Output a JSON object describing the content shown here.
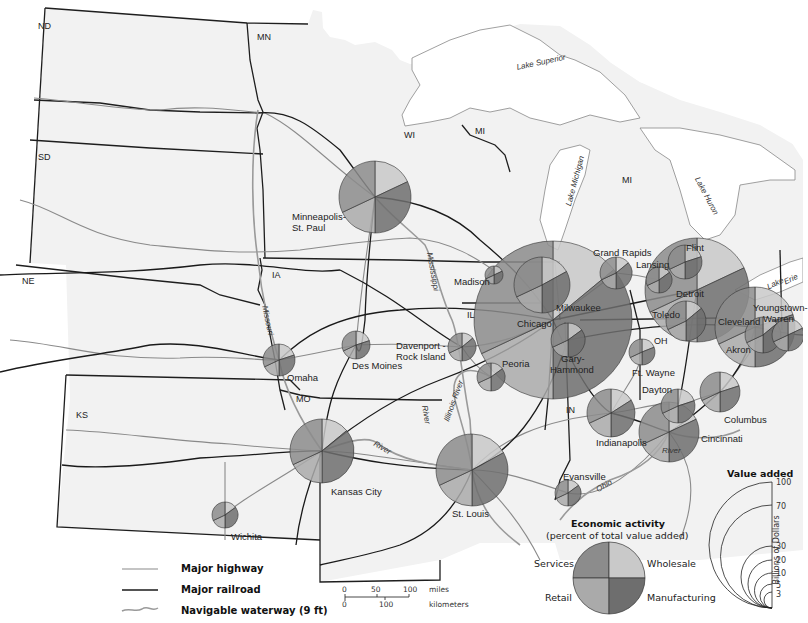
{
  "chart_data": {
    "type": "map",
    "states": [
      "ND",
      "MN",
      "SD",
      "WI",
      "MI",
      "MI",
      "NE",
      "IA",
      "IL",
      "IN",
      "OH",
      "MO",
      "KS"
    ],
    "water_labels": [
      "Lake Superior",
      "Lake Michigan",
      "Lake Huron",
      "Lake Erie",
      "Mississippi",
      "Missouri",
      "River",
      "Illinois River",
      "River",
      "Ohio",
      "River"
    ],
    "cities": [
      {
        "name": "Minneapolis-St. Paul",
        "cx": 375,
        "cy": 197,
        "r": 36,
        "value_added_billions": 30
      },
      {
        "name": "Madison",
        "cx": 494,
        "cy": 275,
        "r": 9,
        "value_added_billions": 3
      },
      {
        "name": "Milwaukee",
        "cx": 542,
        "cy": 285,
        "r": 28,
        "value_added_billions": 20
      },
      {
        "name": "Chicago",
        "cx": 553,
        "cy": 320,
        "r": 79,
        "value_added_billions": 100
      },
      {
        "name": "Grand Rapids",
        "cx": 616,
        "cy": 273,
        "r": 16,
        "value_added_billions": 7
      },
      {
        "name": "Lansing",
        "cx": 659,
        "cy": 280,
        "r": 13,
        "value_added_billions": 5
      },
      {
        "name": "Flint",
        "cx": 685,
        "cy": 262,
        "r": 17,
        "value_added_billions": 7
      },
      {
        "name": "Detroit",
        "cx": 697,
        "cy": 290,
        "r": 52,
        "value_added_billions": 70
      },
      {
        "name": "Toledo",
        "cx": 686,
        "cy": 321,
        "r": 20,
        "value_added_billions": 10
      },
      {
        "name": "Cleveland",
        "cx": 755,
        "cy": 327,
        "r": 40,
        "value_added_billions": 30
      },
      {
        "name": "Akron",
        "cx": 763,
        "cy": 335,
        "r": 18,
        "value_added_billions": 7
      },
      {
        "name": "Youngstown-Warren",
        "cx": 788,
        "cy": 335,
        "r": 16,
        "value_added_billions": 5
      },
      {
        "name": "Gary-Hammond",
        "cx": 568,
        "cy": 340,
        "r": 17,
        "value_added_billions": 7
      },
      {
        "name": "Peoria",
        "cx": 491,
        "cy": 377,
        "r": 14,
        "value_added_billions": 5
      },
      {
        "name": "Davenport-Rock Island",
        "cx": 462,
        "cy": 347,
        "r": 14,
        "value_added_billions": 5
      },
      {
        "name": "Des Moines",
        "cx": 356,
        "cy": 345,
        "r": 14,
        "value_added_billions": 5
      },
      {
        "name": "Omaha",
        "cx": 279,
        "cy": 360,
        "r": 16,
        "value_added_billions": 7
      },
      {
        "name": "Ft. Wayne",
        "cx": 642,
        "cy": 352,
        "r": 13,
        "value_added_billions": 5
      },
      {
        "name": "Dayton",
        "cx": 678,
        "cy": 406,
        "r": 17,
        "value_added_billions": 7
      },
      {
        "name": "Columbus",
        "cx": 720,
        "cy": 392,
        "r": 20,
        "value_added_billions": 10
      },
      {
        "name": "Indianapolis",
        "cx": 611,
        "cy": 413,
        "r": 24,
        "value_added_billions": 15
      },
      {
        "name": "Cincinnati",
        "cx": 669,
        "cy": 432,
        "r": 30,
        "value_added_billions": 20
      },
      {
        "name": "Kansas City",
        "cx": 322,
        "cy": 451,
        "r": 32,
        "value_added_billions": 20
      },
      {
        "name": "St. Louis",
        "cx": 472,
        "cy": 470,
        "r": 36,
        "value_added_billions": 30
      },
      {
        "name": "Evansville",
        "cx": 568,
        "cy": 493,
        "r": 13,
        "value_added_billions": 5
      },
      {
        "name": "Wichita",
        "cx": 225,
        "cy": 515,
        "r": 13,
        "value_added_billions": 3
      }
    ],
    "legend": {
      "economic_activity_categories": [
        "Services",
        "Wholesale",
        "Retail",
        "Manufacturing"
      ],
      "value_added_scale_billions": [
        100,
        70,
        30,
        20,
        10,
        5,
        3
      ],
      "value_added_axis_label": "Billions of Dollars"
    }
  },
  "map": {
    "states": [
      {
        "label": "ND",
        "x": 38,
        "y": 22
      },
      {
        "label": "MN",
        "x": 257,
        "y": 33
      },
      {
        "label": "SD",
        "x": 38,
        "y": 153
      },
      {
        "label": "WI",
        "x": 404,
        "y": 131
      },
      {
        "label": "MI",
        "x": 475,
        "y": 127
      },
      {
        "label": "MI",
        "x": 622,
        "y": 176
      },
      {
        "label": "NE",
        "x": 22,
        "y": 277
      },
      {
        "label": "IA",
        "x": 272,
        "y": 271
      },
      {
        "label": "IL",
        "x": 467,
        "y": 311
      },
      {
        "label": "IN",
        "x": 566,
        "y": 406
      },
      {
        "label": "OH",
        "x": 654,
        "y": 337
      },
      {
        "label": "MO",
        "x": 296,
        "y": 395
      },
      {
        "label": "KS",
        "x": 76,
        "y": 411
      }
    ],
    "cities": [
      {
        "label": "Minneapolis-",
        "x": 292,
        "y": 212
      },
      {
        "label": "St. Paul",
        "x": 292,
        "y": 223
      },
      {
        "label": "Madison",
        "x": 454,
        "y": 277
      },
      {
        "label": "Milwaukee",
        "x": 556,
        "y": 303
      },
      {
        "label": "Chicago",
        "x": 517,
        "y": 319
      },
      {
        "label": "Grand Rapids",
        "x": 593,
        "y": 248
      },
      {
        "label": "Lansing",
        "x": 636,
        "y": 260
      },
      {
        "label": "Flint",
        "x": 686,
        "y": 243
      },
      {
        "label": "Detroit",
        "x": 676,
        "y": 289
      },
      {
        "label": "Toledo",
        "x": 652,
        "y": 310
      },
      {
        "label": "Cleveland",
        "x": 718,
        "y": 317
      },
      {
        "label": "Akron",
        "x": 726,
        "y": 345
      },
      {
        "label": "Youngstown-",
        "x": 753,
        "y": 303
      },
      {
        "label": "Warren",
        "x": 763,
        "y": 314
      },
      {
        "label": "Gary-",
        "x": 561,
        "y": 354
      },
      {
        "label": "Hammond",
        "x": 550,
        "y": 365
      },
      {
        "label": "Peoria",
        "x": 502,
        "y": 359
      },
      {
        "label": "Davenport -",
        "x": 396,
        "y": 341
      },
      {
        "label": "Rock Island",
        "x": 396,
        "y": 352
      },
      {
        "label": "Des Moines",
        "x": 352,
        "y": 361
      },
      {
        "label": "Omaha",
        "x": 287,
        "y": 373
      },
      {
        "label": "Ft. Wayne",
        "x": 632,
        "y": 368
      },
      {
        "label": "Dayton",
        "x": 642,
        "y": 385
      },
      {
        "label": "Columbus",
        "x": 724,
        "y": 415
      },
      {
        "label": "Indianapolis",
        "x": 596,
        "y": 438
      },
      {
        "label": "Cincinnati",
        "x": 701,
        "y": 434
      },
      {
        "label": "Kansas City",
        "x": 331,
        "y": 487
      },
      {
        "label": "St. Louis",
        "x": 452,
        "y": 509
      },
      {
        "label": "Evansville",
        "x": 563,
        "y": 472
      },
      {
        "label": "Wichita",
        "x": 231,
        "y": 532
      }
    ],
    "water": [
      {
        "label": "Lake Superior",
        "x": 516,
        "y": 64,
        "rot": -12
      },
      {
        "label": "Lake Michigan",
        "x": 565,
        "y": 205,
        "rot": -75
      },
      {
        "label": "Lake Huron",
        "x": 700,
        "y": 176,
        "rot": 62
      },
      {
        "label": "Lake",
        "x": 766,
        "y": 284,
        "rot": -25
      },
      {
        "label": "Erie",
        "x": 783,
        "y": 279,
        "rot": -25
      },
      {
        "label": "Mississippi",
        "x": 433,
        "y": 252,
        "rot": 80
      },
      {
        "label": "Missouri",
        "x": 268,
        "y": 305,
        "rot": 78
      },
      {
        "label": "River",
        "x": 376,
        "y": 440,
        "rot": 30
      },
      {
        "label": "River",
        "x": 428,
        "y": 405,
        "rot": 80
      },
      {
        "label": "Illinois River",
        "x": 443,
        "y": 420,
        "rot": -70
      },
      {
        "label": "Ohio",
        "x": 595,
        "y": 487,
        "rot": -30
      },
      {
        "label": "River",
        "x": 662,
        "y": 447,
        "rot": 0
      }
    ]
  },
  "legend": {
    "lines": [
      {
        "label": "Major highway",
        "type": "highway"
      },
      {
        "label": "Major railroad",
        "type": "railroad"
      },
      {
        "label": "Navigable waterway (9 ft)",
        "type": "waterway"
      }
    ],
    "scale": {
      "miles_ticks": [
        "0",
        "50",
        "100"
      ],
      "km_ticks": [
        "0",
        "100"
      ],
      "miles_label": "miles",
      "km_label": "kilometers"
    },
    "economic_activity": {
      "title": "Economic activity",
      "subtitle": "(percent of total value added)",
      "services": "Services",
      "wholesale": "Wholesale",
      "retail": "Retail",
      "manufacturing": "Manufacturing"
    },
    "value_added": {
      "title": "Value added",
      "ticks": [
        "100",
        "70",
        "30",
        "20",
        "10",
        "5",
        "3"
      ],
      "axis_label": "Billions of Dollars"
    }
  },
  "colors": {
    "land": "#f2f2f2",
    "water": "#ffffff",
    "services": "#8c8c8c",
    "wholesale": "#c9c9c9",
    "retail": "#aaaaaa",
    "manufacturing": "#6e6e6e",
    "highway": "#8a8a8a",
    "railroad": "#1a1a1a",
    "border": "#1e1e1e"
  }
}
